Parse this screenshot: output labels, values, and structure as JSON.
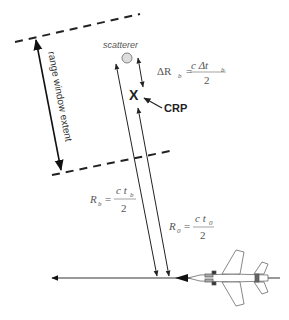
{
  "diagram": {
    "labels": {
      "scatterer": "scatterer",
      "crp_marker": "X",
      "crp": "CRP",
      "range_window": "range window extent"
    },
    "equations": {
      "delta_rb": {
        "lhs": "ΔR",
        "lhs_sub": "b",
        "eq": "=",
        "num": "c Δt",
        "num_sub": "b",
        "den": "2"
      },
      "rb": {
        "lhs": "R",
        "lhs_sub": "b",
        "eq": "=",
        "num": "c t",
        "num_sub": "b",
        "den": "2"
      },
      "r0": {
        "lhs": "R",
        "lhs_sub": "0",
        "eq": "=",
        "num": "c t",
        "num_sub": "0",
        "den": "2"
      }
    },
    "colors": {
      "line": "#222222",
      "text": "#555555",
      "scatterer_fill": "#dddddd"
    }
  }
}
